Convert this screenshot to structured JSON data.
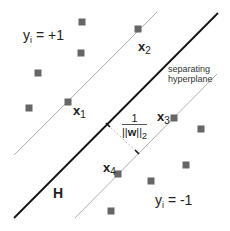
{
  "diagram": {
    "type": "svm-margin-diagram",
    "labels": {
      "class_positive": {
        "var": "y",
        "sub": "i",
        "rest": " = +1"
      },
      "class_negative": {
        "var": "y",
        "sub": "i",
        "rest": " = -1"
      },
      "hyperplane_caption_line1": "separating",
      "hyperplane_caption_line2": "hyperplane",
      "hyperplane_name": "H",
      "margin_numerator": "1",
      "margin_denominator_pre": "||",
      "margin_denominator_w": "w",
      "margin_denominator_post": "||",
      "margin_denominator_sub": "2"
    },
    "support_vectors": [
      {
        "name": "x",
        "sub": "1",
        "x": 68,
        "y": 102
      },
      {
        "name": "x",
        "sub": "2",
        "x": 138,
        "y": 29
      },
      {
        "name": "x",
        "sub": "3",
        "x": 174,
        "y": 118
      },
      {
        "name": "x",
        "sub": "4",
        "x": 118,
        "y": 174
      }
    ],
    "points_positive": [
      {
        "x": 82,
        "y": 22
      },
      {
        "x": 81,
        "y": 53
      },
      {
        "x": 38,
        "y": 73
      },
      {
        "x": 29,
        "y": 108
      }
    ],
    "points_negative": [
      {
        "x": 201,
        "y": 129
      },
      {
        "x": 186,
        "y": 165
      },
      {
        "x": 151,
        "y": 181
      },
      {
        "x": 111,
        "y": 211
      }
    ],
    "lines": {
      "hyperplane": {
        "x1": 14,
        "y1": 218,
        "x2": 218,
        "y2": 13
      },
      "margin_upper": {
        "x1": 14,
        "y1": 155,
        "x2": 157,
        "y2": 12
      },
      "margin_lower": {
        "x1": 75,
        "y1": 218,
        "x2": 217,
        "y2": 74
      },
      "margin_arrow": {
        "x1": 108,
        "y1": 125,
        "x2": 137,
        "y2": 152
      }
    },
    "colors": {
      "point_fill": "#666666",
      "hyperplane": "#111111",
      "margin_lines": "#9a9a9a",
      "margin_arrow": "#aaaaaa"
    }
  }
}
